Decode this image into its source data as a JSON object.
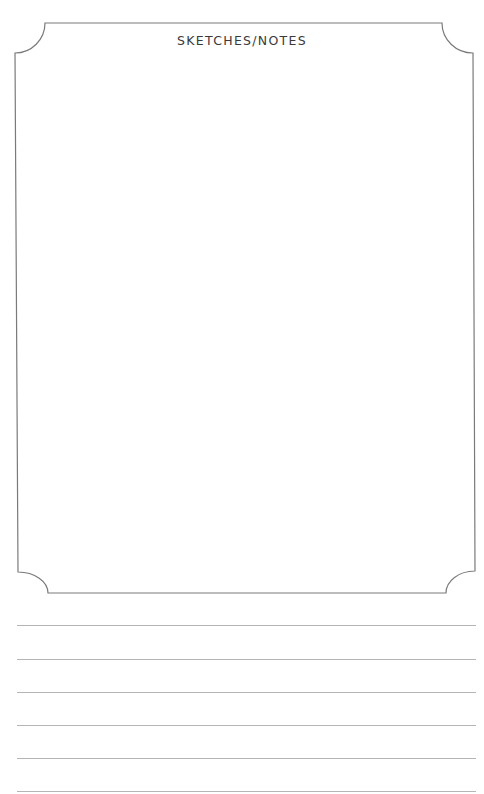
{
  "page": {
    "title": "SKETCHES/NOTES",
    "frame_color": "#7a7a7a",
    "line_color": "#b5b5b5",
    "ruled_lines": [
      {
        "y": 625
      },
      {
        "y": 659
      },
      {
        "y": 692
      },
      {
        "y": 725
      },
      {
        "y": 758
      },
      {
        "y": 791
      }
    ]
  }
}
